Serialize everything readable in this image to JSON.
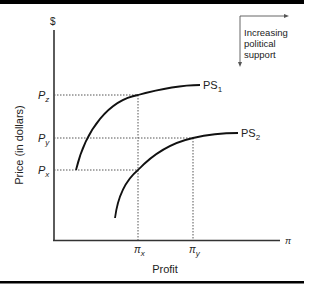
{
  "diagram": {
    "y_axis_symbol": "$",
    "x_axis_symbol": "π",
    "y_axis_label": "Price (in dollars)",
    "x_axis_label": "Profit",
    "price_ticks": [
      {
        "base": "P",
        "sub": "z"
      },
      {
        "base": "P",
        "sub": "y"
      },
      {
        "base": "P",
        "sub": "x"
      }
    ],
    "profit_ticks": [
      {
        "base": "π",
        "sub": "x"
      },
      {
        "base": "π",
        "sub": "y"
      }
    ],
    "curves": [
      {
        "base": "PS",
        "sub": "1"
      },
      {
        "base": "PS",
        "sub": "2"
      }
    ],
    "legend": {
      "line1": "Increasing",
      "line2": "political",
      "line3": "support"
    },
    "colors": {
      "ink": "#222222",
      "border": "#000000",
      "background": "#ffffff"
    }
  }
}
